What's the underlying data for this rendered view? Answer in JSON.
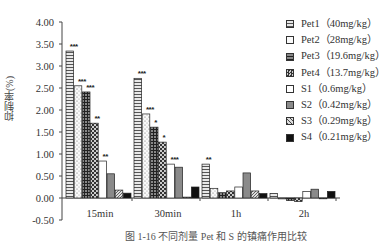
{
  "chart_data": {
    "type": "bar",
    "title": "",
    "xlabel": "",
    "ylabel": "抑制率(%)",
    "ylim": [
      -0.5,
      4.0
    ],
    "yticks": [
      "4.00",
      "3.50",
      "3.00",
      "2.50",
      "2.00",
      "1.50",
      "1.00",
      "0.50",
      "0.00",
      "-0.50"
    ],
    "grid": false,
    "legend_position": "right",
    "categories": [
      "15min",
      "30min",
      "1h",
      "2h"
    ],
    "series": [
      {
        "name": "Pet1（40mg/kg）",
        "pattern": "hstripes",
        "values": [
          3.34,
          2.72,
          0.77,
          0.1
        ],
        "sig": [
          "***",
          "***",
          "**",
          ""
        ]
      },
      {
        "name": "Pet2（28mg/kg）",
        "pattern": "dots",
        "values": [
          2.55,
          1.91,
          0.22,
          -0.02
        ],
        "sig": [
          "***",
          "***",
          "",
          ""
        ]
      },
      {
        "name": "Pet3（19.6mg/kg）",
        "pattern": "grid",
        "values": [
          2.41,
          1.61,
          0.12,
          -0.06
        ],
        "sig": [
          "***",
          "*",
          "",
          ""
        ]
      },
      {
        "name": "Pet4（13.7mg/kg）",
        "pattern": "checker",
        "values": [
          1.7,
          1.27,
          0.16,
          -0.08
        ],
        "sig": [
          "**",
          "*",
          "",
          ""
        ]
      },
      {
        "name": "S1（0.6mg/kg）",
        "pattern": "white",
        "values": [
          0.84,
          0.77,
          0.25,
          0.15
        ],
        "sig": [
          "**",
          "***",
          "",
          ""
        ]
      },
      {
        "name": "S2（0.42mg/kg）",
        "pattern": "gray",
        "values": [
          0.55,
          0.7,
          0.57,
          0.2
        ],
        "sig": [
          "",
          "",
          "",
          ""
        ]
      },
      {
        "name": "S3（0.29mg/kg）",
        "pattern": "diag",
        "values": [
          0.18,
          0.02,
          0.16,
          0.0
        ],
        "sig": [
          "",
          "",
          "",
          ""
        ]
      },
      {
        "name": "S4（0.21mg/kg）",
        "pattern": "black",
        "values": [
          0.11,
          0.25,
          0.1,
          0.15
        ],
        "sig": [
          "",
          "",
          "",
          ""
        ]
      }
    ]
  },
  "caption": "图 1-16  不同剂量 Pet 和 S 的镇痛作用比较"
}
